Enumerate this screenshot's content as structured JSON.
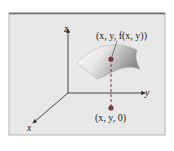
{
  "diagram": {
    "axes": {
      "x_label": "x",
      "y_label": "y",
      "z_label": "z"
    },
    "points": {
      "surface_point_label": "(x, y, f(x, y))",
      "base_point_label": "(x, y, 0)"
    },
    "colors": {
      "panel_bg": "#e8e8e8",
      "panel_top_border": "#6a6a6a",
      "panel_side_border": "#b0b0b0",
      "surface_light": "#f7f7f7",
      "surface_dark": "#8f8f8f",
      "point": "#7a3a3a",
      "axis": "#333333"
    }
  }
}
